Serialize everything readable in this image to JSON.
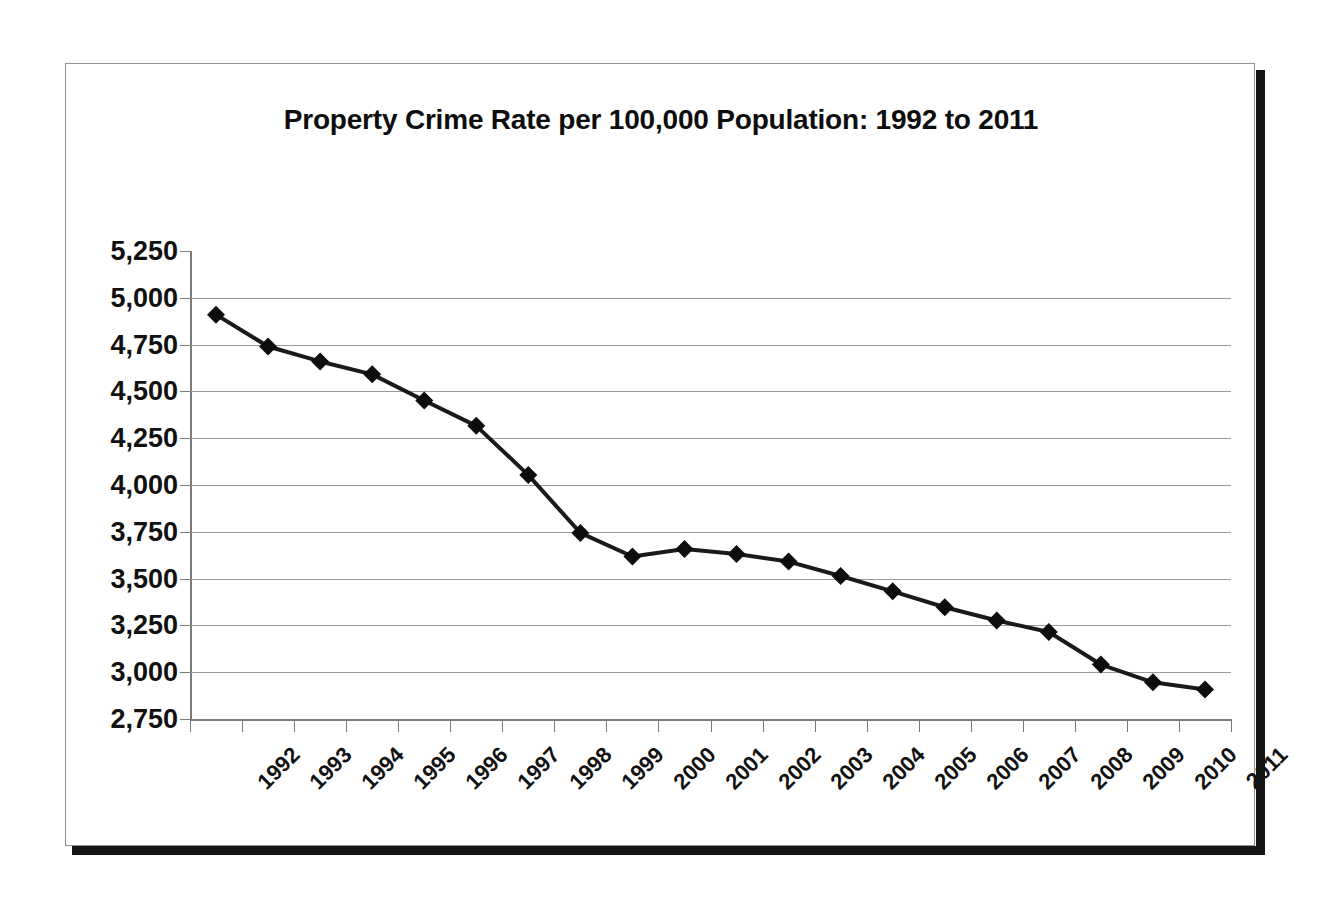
{
  "chart_data": {
    "type": "line",
    "title": "Property Crime Rate per 100,000 Population: 1992 to 2011",
    "xlabel": "",
    "ylabel": "",
    "grid": true,
    "legend": "none",
    "marker": "diamond",
    "line_color": "#1a1a1a",
    "marker_color": "#0d0d0d",
    "grid_color": "#9a9a9a",
    "ylim": [
      2750,
      5250
    ],
    "ytick_step": 250,
    "ytick_labels": [
      "5,250",
      "5,000",
      "4,750",
      "4,500",
      "4,250",
      "4,000",
      "3,750",
      "3,500",
      "3,250",
      "3,000",
      "2,750"
    ],
    "ytick_values": [
      5250,
      5000,
      4750,
      4500,
      4250,
      4000,
      3750,
      3500,
      3250,
      3000,
      2750
    ],
    "categories": [
      "1992",
      "1993",
      "1994",
      "1995",
      "1996",
      "1997",
      "1998",
      "1999",
      "2000",
      "2001",
      "2002",
      "2003",
      "2004",
      "2005",
      "2006",
      "2007",
      "2008",
      "2009",
      "2010",
      "2011"
    ],
    "values": [
      4910,
      4740,
      4660,
      4591,
      4451,
      4316,
      4053,
      3744,
      3618,
      3658,
      3631,
      3591,
      3514,
      3432,
      3347,
      3276,
      3215,
      3041,
      2946,
      2908
    ],
    "series": [
      {
        "name": "Property Crime Rate",
        "values": [
          4910,
          4740,
          4660,
          4591,
          4451,
          4316,
          4053,
          3744,
          3618,
          3658,
          3631,
          3591,
          3514,
          3432,
          3347,
          3276,
          3215,
          3041,
          2946,
          2908
        ]
      }
    ]
  }
}
